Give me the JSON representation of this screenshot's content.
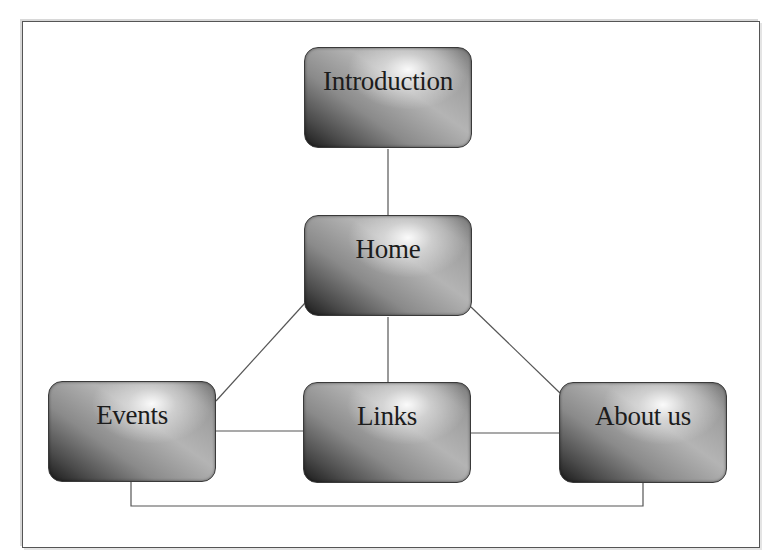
{
  "diagram": {
    "type": "site-map",
    "nodes": [
      {
        "id": "introduction",
        "label": "Introduction"
      },
      {
        "id": "home",
        "label": "Home"
      },
      {
        "id": "events",
        "label": "Events"
      },
      {
        "id": "links",
        "label": "Links"
      },
      {
        "id": "about-us",
        "label": "About us"
      }
    ],
    "edges": [
      {
        "from": "introduction",
        "to": "home"
      },
      {
        "from": "home",
        "to": "events"
      },
      {
        "from": "home",
        "to": "links"
      },
      {
        "from": "home",
        "to": "about-us"
      },
      {
        "from": "events",
        "to": "links"
      },
      {
        "from": "links",
        "to": "about-us"
      },
      {
        "from": "events",
        "to": "about-us"
      }
    ],
    "colors": {
      "node_dark": "#1a1a1a",
      "node_light": "#b4b4b4",
      "line": "#555555",
      "text": "#1c1c1c"
    }
  }
}
